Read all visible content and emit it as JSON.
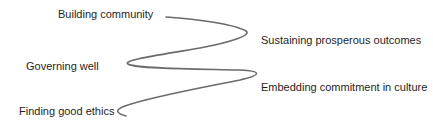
{
  "diagram": {
    "type": "zigzag-curve",
    "line_color": "#6a6a6a",
    "text_color": "#1e1e1e",
    "labels": [
      {
        "id": "building-community",
        "text": "Building community",
        "side": "left",
        "order": 1
      },
      {
        "id": "sustaining-prosperous-outcomes",
        "text": "Sustaining prosperous outcomes",
        "side": "right",
        "order": 2
      },
      {
        "id": "governing-well",
        "text": "Governing well",
        "side": "left",
        "order": 3
      },
      {
        "id": "embedding-commitment-in-culture",
        "text": "Embedding commitment in culture",
        "side": "right",
        "order": 4
      },
      {
        "id": "finding-good-ethics",
        "text": "Finding good ethics",
        "side": "left",
        "order": 5
      }
    ]
  }
}
